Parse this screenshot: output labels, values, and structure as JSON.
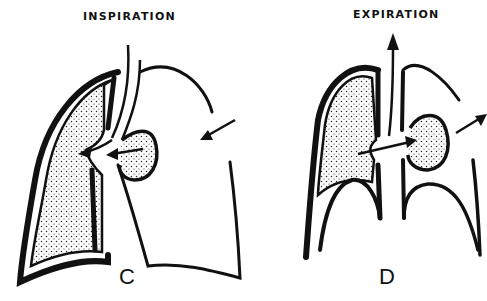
{
  "panels": [
    {
      "title": "INSPIRATION",
      "letter": "C"
    },
    {
      "title": "EXPIRATION",
      "letter": "D"
    }
  ],
  "colors": {
    "ink": "#111111",
    "background": "#ffffff",
    "stipple": "#222222"
  }
}
